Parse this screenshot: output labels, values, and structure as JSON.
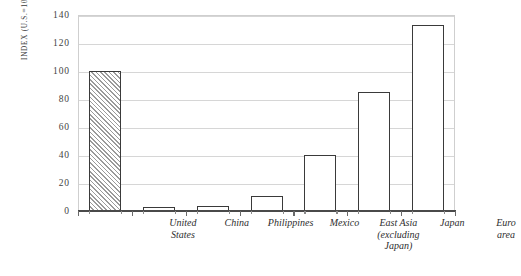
{
  "chart_data": {
    "type": "bar",
    "title": "",
    "subtitle": "",
    "xlabel": "",
    "ylabel": "INDEX (U.S.=100)",
    "ylim": [
      0,
      140
    ],
    "yticks": [
      0,
      20,
      40,
      60,
      80,
      100,
      120,
      140
    ],
    "ytick_labels": [
      "0",
      "20",
      "40",
      "60",
      "80",
      "100",
      "120",
      "140"
    ],
    "grid": true,
    "legend": false,
    "legend_position": "none",
    "categories": [
      "United States",
      "China",
      "Philippines",
      "Mexico",
      "East Asia (excluding Japan)",
      "Japan",
      "Euro area"
    ],
    "category_label_lines": [
      "United\nStates",
      "China",
      "Philippines",
      "Mexico",
      "East Asia\n(excluding\nJapan)",
      "Japan",
      "Euro\narea"
    ],
    "values": [
      100,
      3,
      3.5,
      11,
      40,
      85,
      133
    ],
    "bar_styles": [
      "hatched",
      "outline",
      "outline",
      "outline",
      "outline",
      "outline",
      "outline"
    ],
    "annotations": []
  },
  "style": {
    "background": "#ffffff",
    "bar_outline": "#3a3a3a",
    "bar_fill": "#ffffff",
    "hatch_color": "#9a9a9a",
    "gridline_color": "#d6d6d6",
    "frame_color": "#cfcfcf",
    "axis_color": "#4a4a4a",
    "text_color": "#2e2e2e"
  }
}
